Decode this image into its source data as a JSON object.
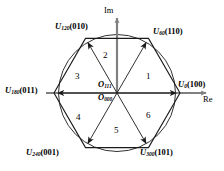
{
  "figure": {
    "type": "space-vector-hexagon",
    "colors": {
      "outline": "#1a1a1a",
      "axis": "#808080",
      "text": "#000000",
      "background": "#ffffff"
    }
  },
  "axes": {
    "imaginary": {
      "label": "Im",
      "direction": "up"
    },
    "real": {
      "label": "Re",
      "direction": "right"
    }
  },
  "origin": {
    "labels": [
      {
        "symbol": "O",
        "sub": "111"
      },
      {
        "symbol": "O",
        "sub": "000"
      }
    ]
  },
  "vectors": [
    {
      "id": "u0",
      "symbol": "U",
      "sub": "0",
      "code": "(100)",
      "angle_deg": 0,
      "position": "right"
    },
    {
      "id": "u60",
      "symbol": "U",
      "sub": "60",
      "code": "(110)",
      "angle_deg": 60,
      "position": "top-right"
    },
    {
      "id": "u120",
      "symbol": "U",
      "sub": "120",
      "code": "(010)",
      "angle_deg": 120,
      "position": "top-left"
    },
    {
      "id": "u180",
      "symbol": "U",
      "sub": "180",
      "code": "(011)",
      "angle_deg": 180,
      "position": "left"
    },
    {
      "id": "u240",
      "symbol": "U",
      "sub": "240",
      "code": "(001)",
      "angle_deg": 240,
      "position": "bottom-left"
    },
    {
      "id": "u300",
      "symbol": "U",
      "sub": "300",
      "code": "(101)",
      "angle_deg": 300,
      "position": "bottom-right"
    }
  ],
  "sectors": [
    {
      "number": "1",
      "center_angle_deg": 30
    },
    {
      "number": "2",
      "center_angle_deg": 90
    },
    {
      "number": "3",
      "center_angle_deg": 150
    },
    {
      "number": "4",
      "center_angle_deg": 210
    },
    {
      "number": "5",
      "center_angle_deg": 270
    },
    {
      "number": "6",
      "center_angle_deg": 330
    }
  ]
}
